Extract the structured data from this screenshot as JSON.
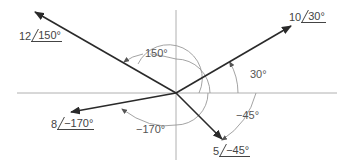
{
  "diagram": {
    "type": "phasor-diagram",
    "colors": {
      "vector": "#2a2a2a",
      "axis": "#aaaaaa",
      "arc": "#999999",
      "text": "#555555"
    },
    "origin": {
      "x": 176,
      "y": 93
    },
    "phasors": [
      {
        "id": "p1",
        "magnitude": "10",
        "angle": "30°",
        "angle_arc_label": "30°"
      },
      {
        "id": "p2",
        "magnitude": "12",
        "angle": "150°",
        "angle_arc_label": "150°"
      },
      {
        "id": "p3",
        "magnitude": "8",
        "angle": "−170°",
        "angle_arc_label": "−170°"
      },
      {
        "id": "p4",
        "magnitude": "5",
        "angle": "−45°",
        "angle_arc_label": "−45°"
      }
    ]
  }
}
